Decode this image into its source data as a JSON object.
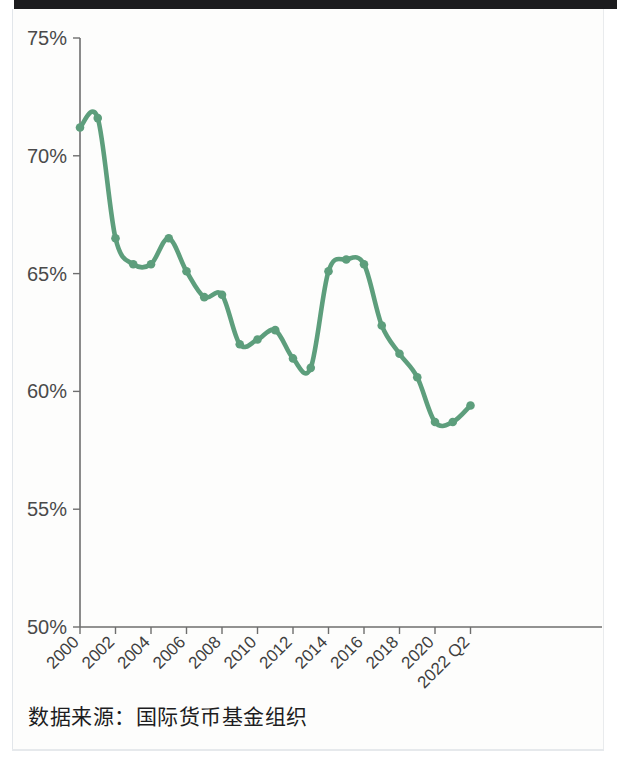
{
  "figure": {
    "source_note": "数据来源：国际货币基金组织",
    "accent_color": "#5d9e7c",
    "axis_color": "#6e6e6e",
    "background_color": "#fdfdfc"
  },
  "chart_data": {
    "type": "line",
    "title": "",
    "subtitle": "",
    "xlabel": "",
    "ylabel": "",
    "ylim": [
      50,
      75
    ],
    "ytick_values": [
      50,
      55,
      60,
      65,
      70,
      75
    ],
    "ytick_labels": [
      "50%",
      "55%",
      "60%",
      "65%",
      "70%",
      "75%"
    ],
    "xtick_labels": [
      "2000",
      "2002",
      "2004",
      "2006",
      "2008",
      "2010",
      "2012",
      "2014",
      "2016",
      "2018",
      "2020",
      "2022 Q2"
    ],
    "xtick_rotation": -45,
    "grid": false,
    "legend": false,
    "legend_position": "none",
    "markers": true,
    "x": [
      "2000",
      "2001",
      "2002",
      "2003",
      "2004",
      "2005",
      "2006",
      "2007",
      "2008",
      "2009",
      "2010",
      "2011",
      "2012",
      "2013",
      "2014",
      "2015",
      "2016",
      "2017",
      "2018",
      "2019",
      "2020",
      "2021",
      "2022 Q2"
    ],
    "series": [
      {
        "name": "USD share of global foreign exchange reserves",
        "color": "#5d9e7c",
        "values": [
          71.2,
          71.6,
          66.5,
          65.4,
          65.4,
          66.5,
          65.1,
          64.0,
          64.1,
          62.0,
          62.2,
          62.6,
          61.4,
          61.0,
          65.1,
          65.6,
          65.4,
          62.8,
          61.6,
          60.6,
          58.7,
          58.7,
          59.4
        ]
      }
    ],
    "units": "percent"
  }
}
